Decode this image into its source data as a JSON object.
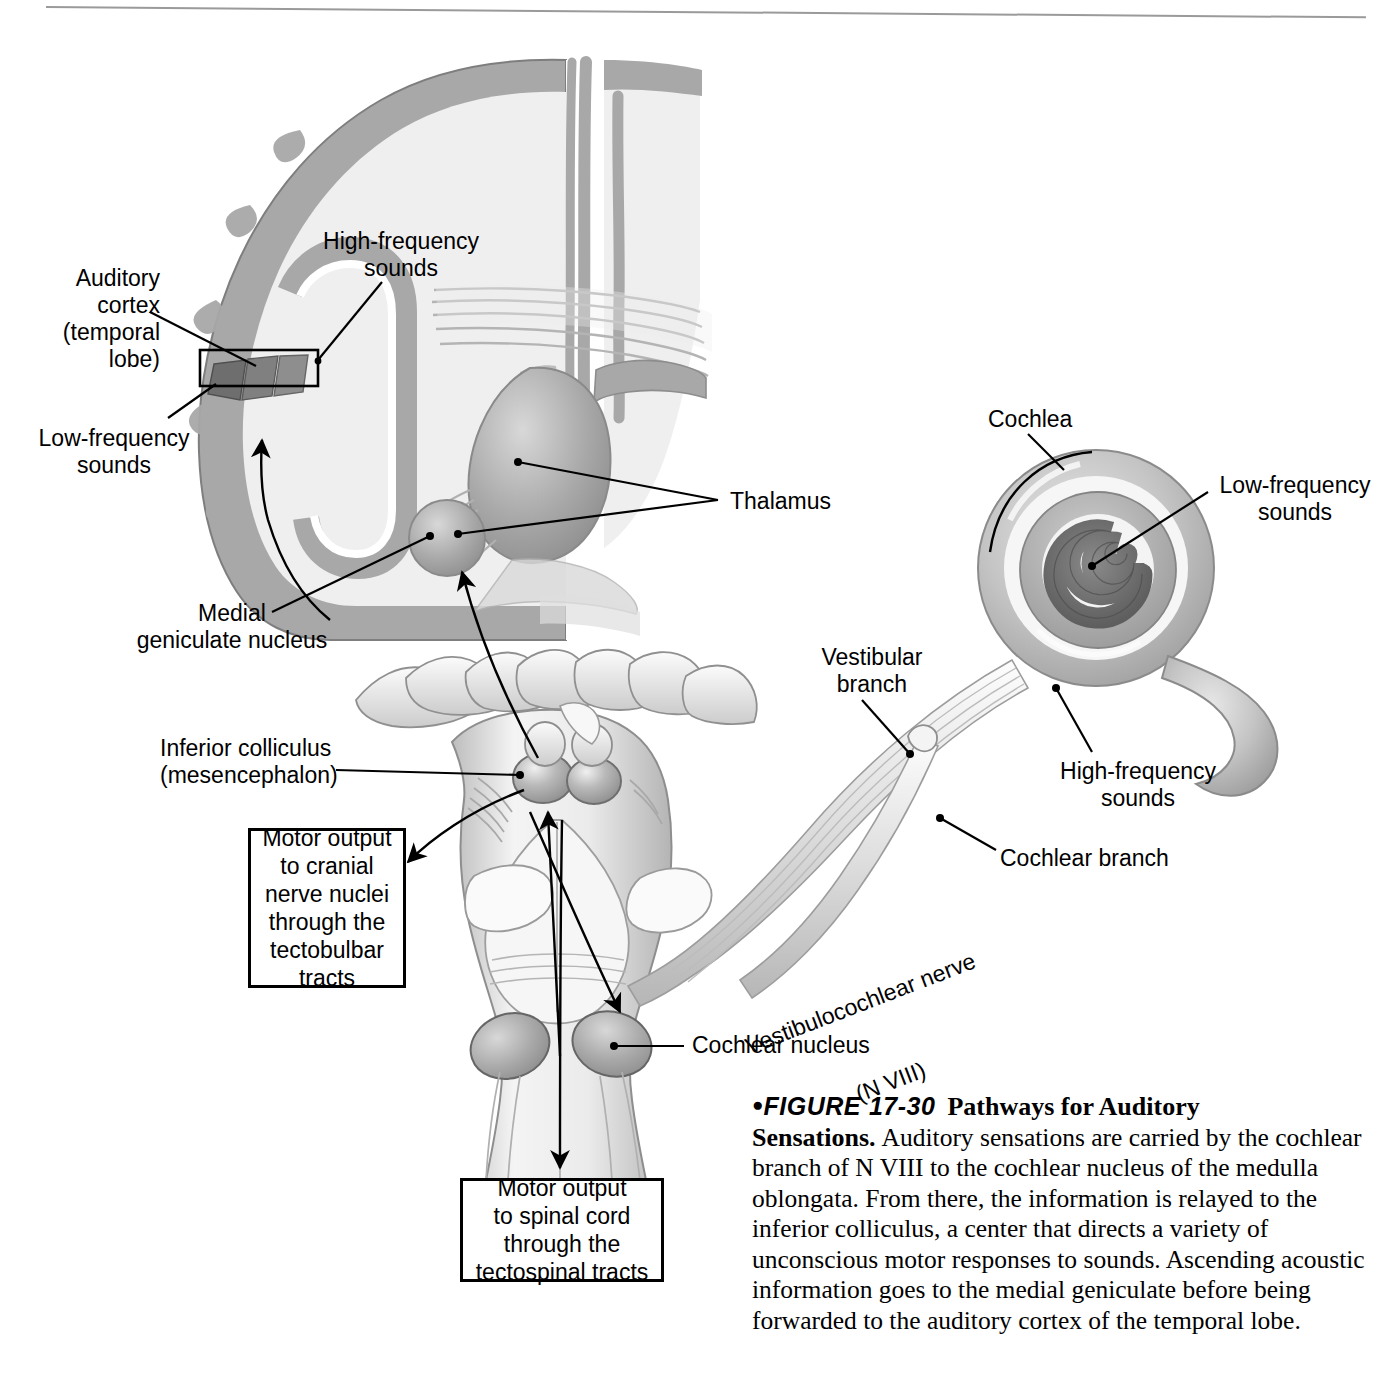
{
  "figure": {
    "id": "17-30",
    "bullet": "●",
    "figure_word": "FIGURE",
    "title": "Pathways for Auditory Sensations.",
    "body": "Auditory sensations are carried by the cochlear branch of N VIII to the cochlear nucleus of the medulla oblongata. From there, the information is relayed to the inferior colliculus, a center that directs a variety of unconscious motor responses to sounds. Ascending acoustic information goes to the medial geniculate before being forwarded to the auditory cortex of the temporal lobe."
  },
  "labels": {
    "auditory_cortex": "Auditory\ncortex\n(temporal\nlobe)",
    "high_frequency_brain": "High-frequency\nsounds",
    "low_frequency_brain": "Low-frequency\nsounds",
    "thalamus": "Thalamus",
    "medial_geniculate": "Medial\ngeniculate nucleus",
    "inferior_colliculus": "Inferior colliculus\n(mesencephalon)",
    "cochlea": "Cochlea",
    "low_frequency_cochlea": "Low-frequency\nsounds",
    "high_frequency_cochlea": "High-frequency\nsounds",
    "vestibular_branch": "Vestibular\nbranch",
    "cochlear_branch": "Cochlear branch",
    "vestibulocochlear_nerve_line1": "Vestibulocochlear nerve",
    "vestibulocochlear_nerve_line2": "(N VIII)",
    "cochlear_nucleus": "Cochlear nucleus"
  },
  "callouts": {
    "tectobulbar": "Motor output\nto cranial\nnerve nuclei\nthrough the\ntectobulbar\ntracts",
    "tectospinal": "Motor output\nto spinal cord\nthrough the\ntectospinal tracts"
  },
  "colors": {
    "ink": "#000000",
    "cortex_gray": "#a8a8a8",
    "white_matter": "#eeeeee",
    "nucleus_gray": "#b5b5b5",
    "dark_band": "#6e6e6e",
    "mid_band": "#8c8c8c",
    "rule_gray": "#9a9a9a",
    "brainstem_light": "#f2f2f2",
    "brainstem_shade": "#c9c9c9"
  }
}
